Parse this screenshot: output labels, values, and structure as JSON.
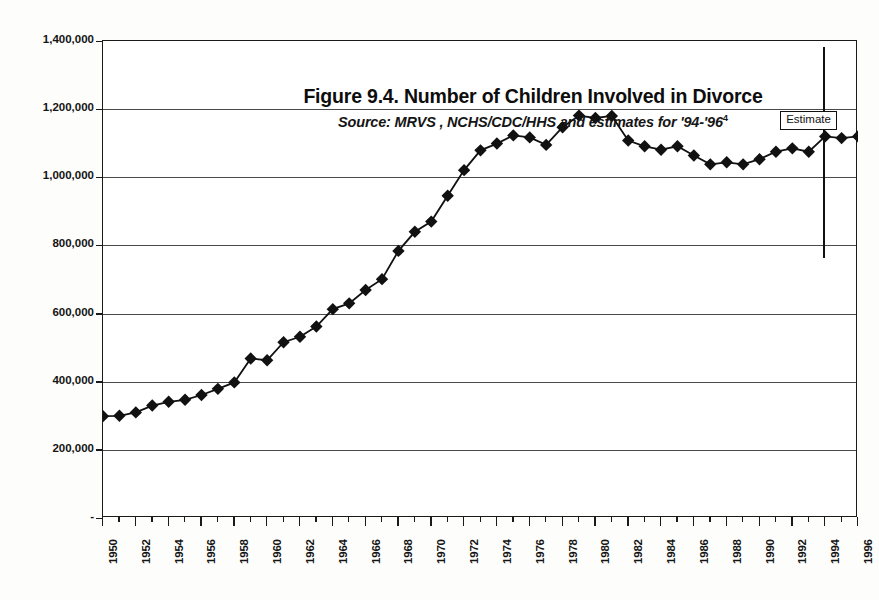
{
  "figure": {
    "title": "Figure 9.4.  Number of Children Involved in Divorce",
    "subtitle_main": "Source: MRVS , NCHS/CDC/HHS and estimates for '94-'96",
    "subtitle_superscript": "4",
    "annotation_label": "Estimate"
  },
  "chart_data": {
    "type": "line",
    "title": "Figure 9.4.  Number of Children Involved in Divorce",
    "subtitle": "Source: MRVS , NCHS/CDC/HHS and estimates for '94-'96",
    "xlabel": "",
    "ylabel": "",
    "grid": true,
    "legend": null,
    "marker": "diamond",
    "xlim": [
      1950,
      1996
    ],
    "ylim": [
      0,
      1400000
    ],
    "ytick_labels": [
      "1,400,000",
      "1,200,000",
      "1,000,000",
      "800,000",
      "600,000",
      "400,000",
      "200,000",
      "-"
    ],
    "ytick_values": [
      1400000,
      1200000,
      1000000,
      800000,
      600000,
      400000,
      200000,
      0
    ],
    "xtick_labels": [
      "1950",
      "1952",
      "1954",
      "1956",
      "1958",
      "1960",
      "1962",
      "1964",
      "1966",
      "1968",
      "1970",
      "1972",
      "1974",
      "1976",
      "1978",
      "1980",
      "1982",
      "1984",
      "1986",
      "1988",
      "1990",
      "1992",
      "1994",
      "1996"
    ],
    "xtick_values": [
      1950,
      1952,
      1954,
      1956,
      1958,
      1960,
      1962,
      1964,
      1966,
      1968,
      1970,
      1972,
      1974,
      1976,
      1978,
      1980,
      1982,
      1984,
      1986,
      1988,
      1990,
      1992,
      1994,
      1996
    ],
    "x": [
      1950,
      1951,
      1952,
      1953,
      1954,
      1955,
      1956,
      1957,
      1958,
      1959,
      1960,
      1961,
      1962,
      1963,
      1964,
      1965,
      1966,
      1967,
      1968,
      1969,
      1970,
      1971,
      1972,
      1973,
      1974,
      1975,
      1976,
      1977,
      1978,
      1979,
      1980,
      1981,
      1982,
      1983,
      1984,
      1985,
      1986,
      1987,
      1988,
      1989,
      1990,
      1991,
      1992,
      1993,
      1994,
      1995,
      1996
    ],
    "values": [
      299000,
      300000,
      310000,
      330000,
      341000,
      347000,
      361000,
      379000,
      398000,
      468000,
      463000,
      516000,
      532000,
      562000,
      613000,
      630000,
      669000,
      701000,
      784000,
      840000,
      870000,
      946000,
      1021000,
      1079000,
      1099000,
      1123000,
      1117000,
      1095000,
      1147000,
      1181000,
      1174000,
      1180000,
      1108000,
      1091000,
      1081000,
      1091000,
      1064000,
      1038000,
      1044000,
      1038000,
      1053000,
      1075000,
      1085000,
      1075000,
      1120000,
      1115000,
      1120000
    ],
    "annotations": [
      {
        "label": "Estimate",
        "x": 1994,
        "type": "vertical-divider-with-box"
      }
    ]
  }
}
